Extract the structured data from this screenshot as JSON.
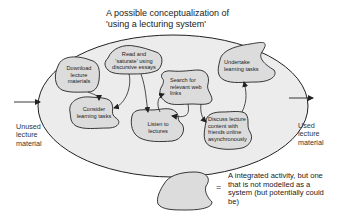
{
  "title": "A possible conceptualization of\n'using a lecturing system'",
  "colors": {
    "system_fill": "#ececec",
    "activity_fill": "#dcdcdc",
    "stroke": "#222222"
  },
  "input_label": "Unused\nlecture\nmaterial",
  "output_label": "Used\nlecture\nmaterial",
  "activities": [
    {
      "id": "download",
      "label": "Download\nlecture\nmaterials"
    },
    {
      "id": "read",
      "label": "Read and\n'saturate' using\ndiscursive essays"
    },
    {
      "id": "consider",
      "label": "Consider\nlearning tasks"
    },
    {
      "id": "listen",
      "label": "Listen to\nlectures"
    },
    {
      "id": "search",
      "label": "Search for\nrelevant web\nlinks"
    },
    {
      "id": "discuss",
      "label": "Discuss lecture\ncontent with\nfriends online\nasynchronously"
    },
    {
      "id": "undertake",
      "label": "Undertake\nlearning tasks"
    }
  ],
  "legend": {
    "symbol": "=",
    "text": "A integrated activity, but one\nthat is not modelled as a\nsystem (but potentially could\nbe)"
  }
}
